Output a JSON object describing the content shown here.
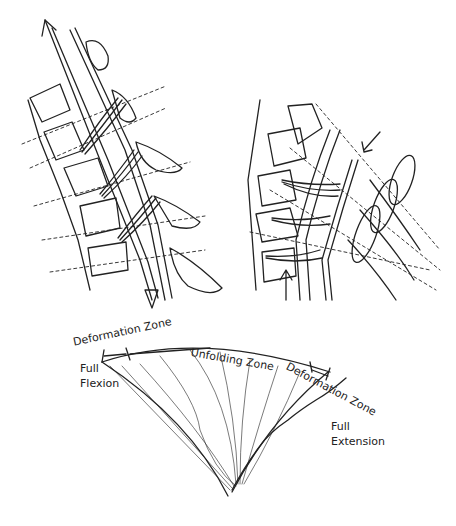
{
  "figure": {
    "panels": [
      {
        "id": "spine-flexion-left",
        "description": "Sagittal spine segment with stretched posterior ligaments, traction arrows at both ends"
      },
      {
        "id": "spine-extension-right",
        "description": "Sagittal spine segment in extension with buckled ligament fibers, compression arrows"
      },
      {
        "id": "fan-diagram",
        "description": "Fan-shaped zone diagram from full flexion to full extension"
      }
    ],
    "labels": {
      "deformation_zone_left": "Deformation Zone",
      "unfolding_zone": "Unfolding Zone",
      "deformation_zone_right": "Deformation Zone",
      "full_flexion_1": "Full",
      "full_flexion_2": "Flexion",
      "full_extension_1": "Full",
      "full_extension_2": "Extension"
    },
    "colors": {
      "ink": "#222222",
      "background": "#ffffff"
    }
  }
}
